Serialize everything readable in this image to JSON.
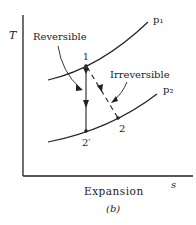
{
  "figure": {
    "caption": "(b)",
    "subtitle": "Expansion"
  },
  "axes": {
    "y_label": "T",
    "x_label": "s"
  },
  "curves": {
    "high_pressure": "p₁",
    "low_pressure": "p₂"
  },
  "points": {
    "start": "1",
    "irreversible_end": "2",
    "reversible_end": "2′"
  },
  "annotations": {
    "reversible": "Reversible",
    "irreversible": "Irreversible"
  },
  "colors": {
    "ink": "#222222",
    "background": "#ffffff"
  }
}
